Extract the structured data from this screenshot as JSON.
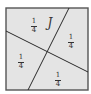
{
  "figure": {
    "colors": {
      "fill": "#e4e4e4",
      "border": "#555555",
      "line": "#2a2a2a",
      "text": "#333333"
    },
    "square": {
      "x": 6,
      "y": 8,
      "size": 82
    },
    "lines": [
      {
        "name": "steep-divider",
        "x1": 69,
        "y1": 8,
        "x2": 28,
        "y2": 90
      },
      {
        "name": "shallow-divider",
        "x1": 6,
        "y1": 31,
        "x2": 88,
        "y2": 72
      }
    ],
    "region_label": {
      "text": "J",
      "x": 50,
      "y": 23
    },
    "fractions": [
      {
        "name": "fraction-top-left",
        "numerator": "1",
        "denominator": "4",
        "x": 34,
        "y": 26
      },
      {
        "name": "fraction-right",
        "numerator": "1",
        "denominator": "4",
        "x": 71,
        "y": 42
      },
      {
        "name": "fraction-left",
        "numerator": "1",
        "denominator": "4",
        "x": 21,
        "y": 62
      },
      {
        "name": "fraction-bottom",
        "numerator": "1",
        "denominator": "4",
        "x": 58,
        "y": 80
      }
    ]
  }
}
